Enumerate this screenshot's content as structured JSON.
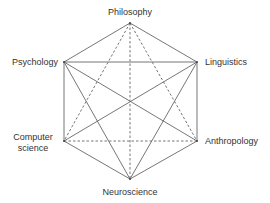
{
  "diagram": {
    "title": "",
    "nodes": [
      {
        "id": "philosophy",
        "label": [
          "Philosophy"
        ]
      },
      {
        "id": "psychology",
        "label": [
          "Psychology"
        ]
      },
      {
        "id": "linguistics",
        "label": [
          "Linguistics"
        ]
      },
      {
        "id": "computer_science",
        "label": [
          "Computer",
          "science"
        ]
      },
      {
        "id": "anthropology",
        "label": [
          "Anthropology"
        ]
      },
      {
        "id": "neuroscience",
        "label": [
          "Neuroscience"
        ]
      }
    ],
    "edges": [
      {
        "from": "philosophy",
        "to": "psychology",
        "style": "solid"
      },
      {
        "from": "philosophy",
        "to": "linguistics",
        "style": "solid"
      },
      {
        "from": "psychology",
        "to": "linguistics",
        "style": "solid"
      },
      {
        "from": "psychology",
        "to": "computer_science",
        "style": "solid"
      },
      {
        "from": "linguistics",
        "to": "anthropology",
        "style": "solid"
      },
      {
        "from": "computer_science",
        "to": "neuroscience",
        "style": "solid"
      },
      {
        "from": "anthropology",
        "to": "neuroscience",
        "style": "solid"
      },
      {
        "from": "psychology",
        "to": "anthropology",
        "style": "solid"
      },
      {
        "from": "linguistics",
        "to": "computer_science",
        "style": "solid"
      },
      {
        "from": "psychology",
        "to": "neuroscience",
        "style": "solid"
      },
      {
        "from": "linguistics",
        "to": "neuroscience",
        "style": "solid"
      },
      {
        "from": "philosophy",
        "to": "computer_science",
        "style": "dashed"
      },
      {
        "from": "philosophy",
        "to": "anthropology",
        "style": "dashed"
      },
      {
        "from": "philosophy",
        "to": "neuroscience",
        "style": "dashed"
      },
      {
        "from": "computer_science",
        "to": "anthropology",
        "style": "dashed"
      }
    ],
    "colors": {
      "line": "#666666",
      "text": "#333333"
    }
  }
}
